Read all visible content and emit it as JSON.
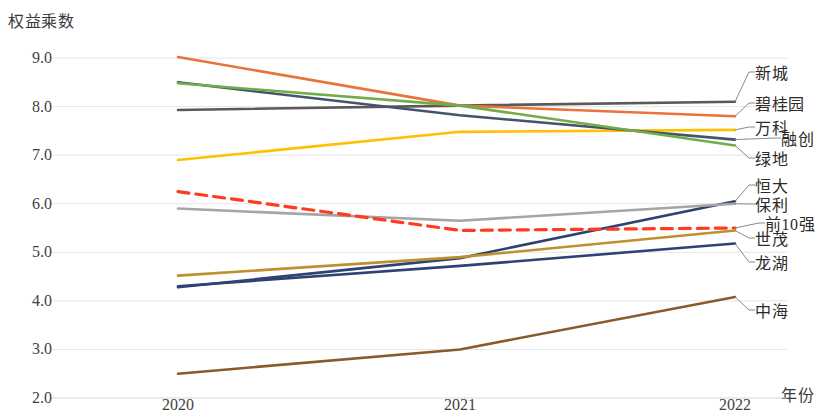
{
  "chart_data": {
    "type": "line",
    "title": "",
    "ylabel": "权益乘数",
    "xlabel": "年份",
    "categories": [
      "2020",
      "2021",
      "2022"
    ],
    "x_tick_labels": [
      "2020",
      "2021",
      "2022"
    ],
    "y_tick_labels": [
      "9.0",
      "8.0",
      "7.0",
      "6.0",
      "5.0",
      "4.0",
      "3.0",
      "2.0"
    ],
    "ylim": [
      2.0,
      9.0
    ],
    "y_tick_step": 1.0,
    "grid": true,
    "legend_position": "right-callouts",
    "series": [
      {
        "name": "新城",
        "values": [
          7.93,
          8.02,
          8.1
        ],
        "color": "#595959",
        "dash": false
      },
      {
        "name": "碧桂园",
        "values": [
          9.02,
          8.02,
          7.8
        ],
        "color": "#E8743B",
        "dash": false
      },
      {
        "name": "万科",
        "values": [
          6.9,
          7.48,
          7.52
        ],
        "color": "#FFC000",
        "dash": false
      },
      {
        "name": "融创",
        "values": [
          8.5,
          7.82,
          7.32
        ],
        "color": "#44546A",
        "dash": false
      },
      {
        "name": "绿地",
        "values": [
          8.48,
          8.02,
          7.2
        ],
        "color": "#70AD47",
        "dash": false
      },
      {
        "name": "恒大",
        "values": [
          4.28,
          4.88,
          6.05
        ],
        "color": "#2E4374",
        "dash": false
      },
      {
        "name": "保利",
        "values": [
          5.9,
          5.65,
          6.0
        ],
        "color": "#A5A5A5",
        "dash": false
      },
      {
        "name": "前10强",
        "values": [
          6.25,
          5.45,
          5.5
        ],
        "color": "#FF3B1F",
        "dash": true
      },
      {
        "name": "世茂",
        "values": [
          4.52,
          4.9,
          5.45
        ],
        "color": "#BF8F30",
        "dash": false
      },
      {
        "name": "龙湖",
        "values": [
          4.3,
          4.72,
          5.18
        ],
        "color": "#2E4374",
        "dash": false
      },
      {
        "name": "中海",
        "values": [
          2.5,
          3.0,
          4.08
        ],
        "color": "#8B5A2B",
        "dash": false
      }
    ],
    "callouts": [
      {
        "label": "新城",
        "value": 8.1
      },
      {
        "label": "碧桂园",
        "value": 7.8
      },
      {
        "label": "万科",
        "value": 7.52
      },
      {
        "label": "融创",
        "value": 7.32
      },
      {
        "label": "绿地",
        "value": 7.2
      },
      {
        "label": "恒大",
        "value": 6.05
      },
      {
        "label": "保利",
        "value": 6.0
      },
      {
        "label": "前10强",
        "value": 5.5
      },
      {
        "label": "世茂",
        "value": 5.45
      },
      {
        "label": "龙湖",
        "value": 5.18
      },
      {
        "label": "中海",
        "value": 4.08
      }
    ]
  }
}
